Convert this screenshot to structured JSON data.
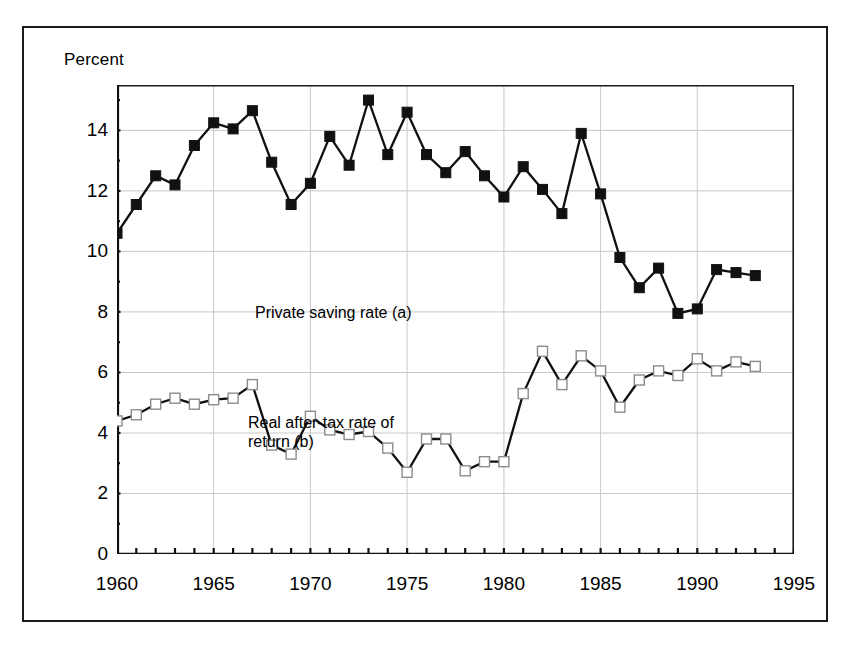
{
  "figure": {
    "y_axis_caption": "Percent",
    "background": "#ffffff",
    "frame_color": "#1a1a1a",
    "grid_color": "#c8c8c8",
    "line_color": "#111111"
  },
  "annotations": {
    "private_saving": "Private saving rate (a)",
    "real_return_line1": "Real after-tax rate of",
    "real_return_line2": "return (b)"
  },
  "axes": {
    "y_tick_labels": [
      "0",
      "2",
      "4",
      "6",
      "8",
      "10",
      "12",
      "14"
    ],
    "y_tick_values": [
      0,
      2,
      4,
      6,
      8,
      10,
      12,
      14
    ],
    "y_minor_step": 1,
    "x_tick_labels": [
      "1960",
      "1965",
      "1970",
      "1975",
      "1980",
      "1985",
      "1990",
      "1995"
    ],
    "x_tick_values": [
      1960,
      1965,
      1970,
      1975,
      1980,
      1985,
      1990,
      1995
    ],
    "x_minor_step": 1
  },
  "chart_data": {
    "type": "line",
    "title": "",
    "xlabel": "",
    "ylabel": "Percent",
    "xlim": [
      1960,
      1995
    ],
    "ylim": [
      0,
      15.5
    ],
    "grid": true,
    "legend": "in-plot annotations",
    "x": [
      1960,
      1961,
      1962,
      1963,
      1964,
      1965,
      1966,
      1967,
      1968,
      1969,
      1970,
      1971,
      1972,
      1973,
      1974,
      1975,
      1976,
      1977,
      1978,
      1979,
      1980,
      1981,
      1982,
      1983,
      1984,
      1985,
      1986,
      1987,
      1988,
      1989,
      1990,
      1991,
      1992,
      1993
    ],
    "series": [
      {
        "name": "Private saving rate (a)",
        "marker": "filled-square",
        "values": [
          10.6,
          11.55,
          12.5,
          12.2,
          13.5,
          14.25,
          14.05,
          14.65,
          12.95,
          11.55,
          12.25,
          13.8,
          12.85,
          15.0,
          13.2,
          14.6,
          13.2,
          12.6,
          13.3,
          12.5,
          11.8,
          12.8,
          12.05,
          11.25,
          13.9,
          11.9,
          9.8,
          8.8,
          9.45,
          7.95,
          8.1,
          9.4,
          9.3,
          9.2
        ]
      },
      {
        "name": "Real after-tax rate of return (b)",
        "marker": "open-square",
        "values": [
          4.4,
          4.6,
          4.95,
          5.15,
          4.95,
          5.1,
          5.15,
          5.6,
          3.6,
          3.3,
          4.55,
          4.1,
          3.95,
          4.05,
          3.5,
          2.7,
          3.8,
          3.8,
          2.75,
          3.05,
          3.05,
          5.3,
          6.7,
          5.6,
          6.55,
          6.05,
          4.85,
          5.75,
          6.05,
          5.9,
          6.45,
          6.05,
          6.35,
          6.2
        ]
      }
    ]
  }
}
